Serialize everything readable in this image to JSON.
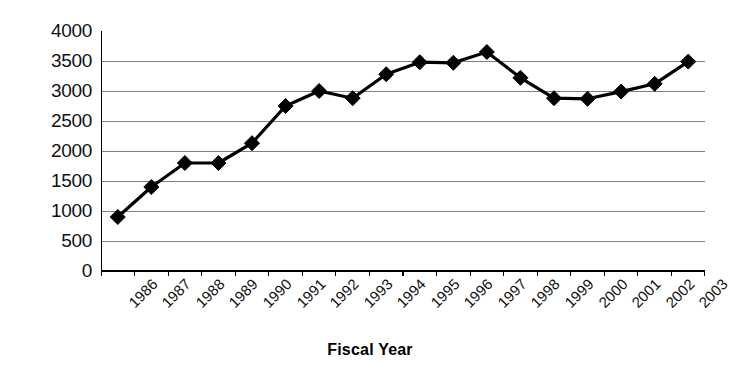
{
  "chart_data": {
    "type": "line",
    "title": "",
    "xlabel": "Fiscal Year",
    "ylabel": "",
    "categories": [
      "1986",
      "1987",
      "1988",
      "1989",
      "1990",
      "1991",
      "1992",
      "1993",
      "1994",
      "1995",
      "1996",
      "1997",
      "1998",
      "1999",
      "2000",
      "2001",
      "2002",
      "2003"
    ],
    "values": [
      900,
      1400,
      1800,
      1800,
      2130,
      2750,
      3000,
      2880,
      3280,
      3480,
      3470,
      3650,
      3220,
      2880,
      2870,
      2990,
      3120,
      3490
    ],
    "series": [
      {
        "name": "",
        "values": [
          900,
          1400,
          1800,
          1800,
          2130,
          2750,
          3000,
          2880,
          3280,
          3480,
          3470,
          3650,
          3220,
          2880,
          2870,
          2990,
          3120,
          3490
        ]
      }
    ],
    "ylim": [
      0,
      4000
    ],
    "y_ticks": [
      0,
      500,
      1000,
      1500,
      2000,
      2500,
      3000,
      3500,
      4000
    ],
    "y_tick_labels": [
      "0",
      "500",
      "1000",
      "1500",
      "2000",
      "2500",
      "3000",
      "3500",
      "4000"
    ],
    "grid": "horizontal",
    "legend": "none",
    "marker": "diamond",
    "line_color": "#000000",
    "marker_color": "#000000",
    "grid_color": "#808080",
    "axis_color": "#000000",
    "background": "#ffffff"
  },
  "axis": {
    "x_title": "Fiscal Year"
  }
}
